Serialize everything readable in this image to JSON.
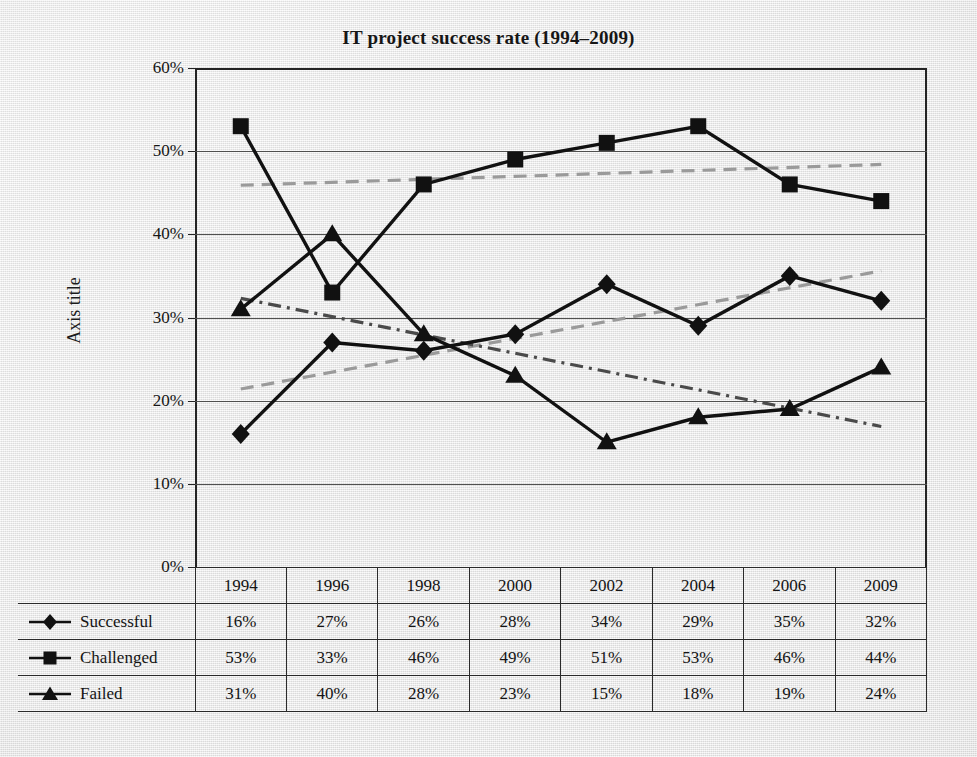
{
  "chart_data": {
    "type": "line",
    "title": "IT project success rate (1994–2009)",
    "xlabel": "",
    "ylabel": "Axis title",
    "categories": [
      "1994",
      "1996",
      "1998",
      "2000",
      "2002",
      "2004",
      "2006",
      "2009"
    ],
    "ylim": [
      0,
      60
    ],
    "ytick_values": [
      0,
      10,
      20,
      30,
      40,
      50,
      60
    ],
    "ytick_labels": [
      "0%",
      "10%",
      "20%",
      "30%",
      "40%",
      "50%",
      "60%"
    ],
    "grid": true,
    "legend_position": "data-table-row-headers",
    "value_suffix": "%",
    "series": [
      {
        "name": "Successful",
        "marker": "diamond",
        "color": "#111111",
        "values": [
          16,
          27,
          26,
          28,
          34,
          29,
          35,
          32
        ],
        "labels": [
          "16%",
          "27%",
          "26%",
          "28%",
          "34%",
          "29%",
          "35%",
          "32%"
        ]
      },
      {
        "name": "Challenged",
        "marker": "square",
        "color": "#111111",
        "values": [
          53,
          33,
          46,
          49,
          51,
          53,
          46,
          44
        ],
        "labels": [
          "53%",
          "33%",
          "46%",
          "49%",
          "51%",
          "53%",
          "46%",
          "44%"
        ]
      },
      {
        "name": "Failed",
        "marker": "triangle",
        "color": "#111111",
        "values": [
          31,
          40,
          28,
          23,
          15,
          18,
          19,
          24
        ],
        "labels": [
          "31%",
          "40%",
          "28%",
          "23%",
          "15%",
          "18%",
          "19%",
          "24%"
        ]
      }
    ],
    "trendlines": [
      {
        "name": "Successful trendline",
        "for_series": "Successful",
        "style": "dashed",
        "color": "#9a9a9a",
        "start_value": 21.4,
        "end_value": 35.6
      },
      {
        "name": "Challenged trendline",
        "for_series": "Challenged",
        "style": "dashed",
        "color": "#9a9a9a",
        "start_value": 45.9,
        "end_value": 48.4
      },
      {
        "name": "Failed trendline",
        "for_series": "Failed",
        "style": "dash-dot",
        "color": "#4a4a4a",
        "start_value": 32.3,
        "end_value": 16.9
      }
    ]
  },
  "table": {
    "corner_label": "",
    "column_headers": [
      "1994",
      "1996",
      "1998",
      "2000",
      "2002",
      "2004",
      "2006",
      "2009"
    ],
    "rows": [
      {
        "label": "Successful",
        "marker": "diamond",
        "values": [
          "16%",
          "27%",
          "26%",
          "28%",
          "34%",
          "29%",
          "35%",
          "32%"
        ]
      },
      {
        "label": "Challenged",
        "marker": "square",
        "values": [
          "53%",
          "33%",
          "46%",
          "49%",
          "51%",
          "53%",
          "46%",
          "44%"
        ]
      },
      {
        "label": "Failed",
        "marker": "triangle",
        "values": [
          "31%",
          "40%",
          "28%",
          "23%",
          "15%",
          "18%",
          "19%",
          "24%"
        ]
      }
    ]
  },
  "colors": {
    "series_line": "#111111",
    "trend_line": "#9a9a9a",
    "gridline": "#50504f",
    "axis": "#242424",
    "background": "#eeeeee",
    "text": "#141414"
  }
}
